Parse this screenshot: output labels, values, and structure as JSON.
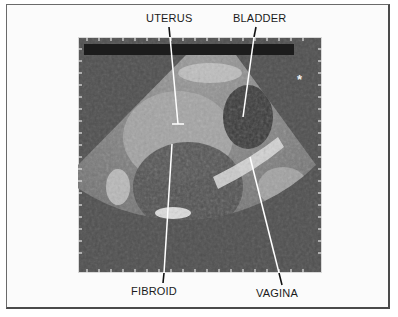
{
  "figure": {
    "type": "ultrasound-diagram",
    "labels": {
      "uterus": "UTERUS",
      "bladder": "BLADDER",
      "fibroid": "FIBROID",
      "vagina": "VAGINA"
    },
    "marker": "*",
    "colors": {
      "background": "#fbfbfb",
      "scan_background": "#4f4f4f",
      "scale_bar": "#1c1c1c",
      "tissue_light": "#c8c8c8",
      "leader_line": "#ffffff",
      "text": "#1a1a1a"
    }
  }
}
